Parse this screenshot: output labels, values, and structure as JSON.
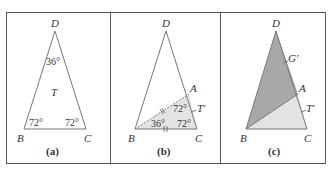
{
  "figure": {
    "colors": {
      "frame": "#555555",
      "edge": "#777777",
      "text": "#333333",
      "dark_fill": "#a8a8a8",
      "light_fill": "#e3e3e3",
      "background": "#ffffff"
    },
    "panels": [
      {
        "id": "a",
        "caption": "(a)",
        "vertices": {
          "D": "D",
          "B": "B",
          "C": "C"
        },
        "angles": {
          "apex": "36°",
          "base_left": "72°",
          "base_right": "72°"
        },
        "region_label": "T"
      },
      {
        "id": "b",
        "caption": "(b)",
        "vertices": {
          "D": "D",
          "A": "A",
          "B": "B",
          "C": "C"
        },
        "angles": {
          "at_A": "72°",
          "at_B": "36°",
          "at_C": "72°"
        },
        "region_label": "T′",
        "tick_marks": "||"
      },
      {
        "id": "c",
        "caption": "(c)",
        "vertices": {
          "D": "D",
          "A": "A",
          "B": "B",
          "C": "C"
        },
        "region_labels": {
          "upper": "G′",
          "lower": "T′"
        }
      }
    ]
  }
}
